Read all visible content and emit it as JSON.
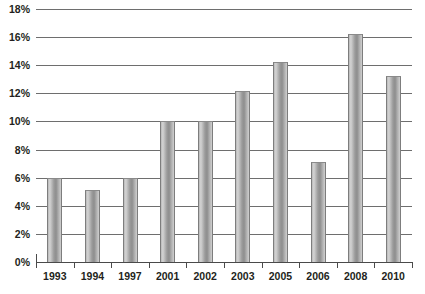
{
  "chart_data": {
    "type": "bar",
    "title": "",
    "subtitle": "",
    "xlabel": "",
    "ylabel": "",
    "categories": [
      "1993",
      "1994",
      "1997",
      "2001",
      "2002",
      "2003",
      "2005",
      "2006",
      "2008",
      "2010"
    ],
    "values": [
      6.0,
      5.1,
      6.0,
      10.0,
      10.0,
      12.2,
      14.2,
      7.1,
      16.2,
      13.2
    ],
    "value_labels": [
      "6%",
      "5%",
      "6%",
      "10%",
      "10%",
      "12%",
      "14%",
      "7%",
      "16%",
      "13%"
    ],
    "ylim": [
      0,
      18
    ],
    "ytick_labels": [
      "0%",
      "2%",
      "4%",
      "6%",
      "8%",
      "10%",
      "12%",
      "14%",
      "16%",
      "18%"
    ],
    "ytick_values": [
      0,
      2,
      4,
      6,
      8,
      10,
      12,
      14,
      16,
      18
    ],
    "grid": true,
    "grid_orientation": "horizontal",
    "legend": false,
    "legend_position": "none",
    "series": [
      {
        "name": "",
        "values": [
          6.0,
          5.1,
          6.0,
          10.0,
          10.0,
          12.2,
          14.2,
          7.1,
          16.2,
          13.2
        ],
        "color": "#a8a8a8"
      }
    ],
    "bar_style": "cylinder-gradient-grayscale",
    "annotations": []
  },
  "colors": {
    "background": "#ffffff",
    "gridline": "#6e6e6e",
    "axis": "#4a4a4a",
    "text": "#231f20",
    "bar_light": "#d4d4d4",
    "bar_dark": "#8e8e8e"
  }
}
